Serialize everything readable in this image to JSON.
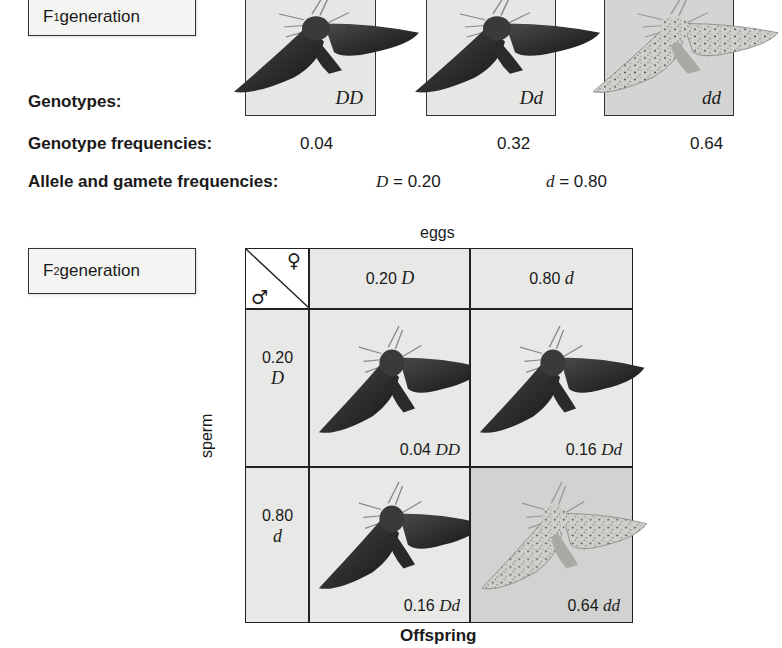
{
  "f1": {
    "title_prefix": "F",
    "title_sub": "1",
    "title_suffix": " generation",
    "genotypes_label": "Genotypes:",
    "freq_label": "Genotype frequencies:",
    "allele_label": "Allele and gamete frequencies:",
    "phenotypes": [
      {
        "genotype": "DD",
        "frequency": "0.04",
        "moth": "dark-moth"
      },
      {
        "genotype": "Dd",
        "frequency": "0.32",
        "moth": "dark-moth"
      },
      {
        "genotype": "dd",
        "frequency": "0.64",
        "moth": "light-peppered-moth"
      }
    ],
    "alleles": [
      {
        "symbol": "D",
        "text": " = 0.20"
      },
      {
        "symbol": "d",
        "text": " = 0.80"
      }
    ]
  },
  "f2": {
    "title_prefix": "F",
    "title_sub": "2",
    "title_suffix": " generation",
    "eggs_label": "eggs",
    "sperm_label": "sperm",
    "offspring_label": "Offspring",
    "female_symbol": "♀",
    "male_symbol": "♂",
    "egg_headers": [
      {
        "freq": "0.20 ",
        "allele": "D"
      },
      {
        "freq": "0.80 ",
        "allele": "d"
      }
    ],
    "sperm_headers": [
      {
        "freq": "0.20",
        "allele": "D"
      },
      {
        "freq": "0.80",
        "allele": "d"
      }
    ],
    "cells": [
      {
        "freq": "0.04 ",
        "genotype": "DD",
        "moth": "dark-moth"
      },
      {
        "freq": "0.16 ",
        "genotype": "Dd",
        "moth": "dark-moth"
      },
      {
        "freq": "0.16 ",
        "genotype": "Dd",
        "moth": "dark-moth"
      },
      {
        "freq": "0.64 ",
        "genotype": "dd",
        "moth": "light-peppered-moth"
      }
    ]
  }
}
